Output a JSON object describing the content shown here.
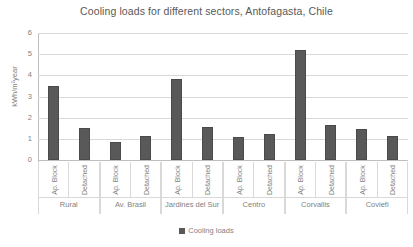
{
  "chart_data": {
    "type": "bar",
    "title": "Cooling loads for different sectors, Antofagasta, Chile",
    "xlabel": "",
    "ylabel": "kWh/m²year",
    "ylim": [
      0,
      6
    ],
    "ytick_labels": [
      "6",
      "5",
      "4",
      "3",
      "2",
      "1",
      "0"
    ],
    "ytick_values": [
      6,
      5,
      4,
      3,
      2,
      1,
      0
    ],
    "grid": true,
    "legend": {
      "position": "bottom",
      "entries": [
        "Cooling loads"
      ]
    },
    "series": [
      {
        "name": "Cooling loads",
        "color": "#595959",
        "values": [
          3.5,
          1.5,
          0.85,
          1.15,
          3.85,
          1.55,
          1.1,
          1.25,
          5.2,
          1.65,
          1.45,
          1.15
        ]
      }
    ],
    "categories": [
      "Ap. Block",
      "Detached",
      "Ap. Block",
      "Detached",
      "Ap. Block",
      "Detached",
      "Ap. Block",
      "Detached",
      "Ap. Block",
      "Detached",
      "Ap. Block",
      "Detached"
    ],
    "groups": [
      {
        "name": "Rural",
        "subcategories": [
          "Ap. Block",
          "Detached"
        ],
        "values": [
          3.5,
          1.5
        ]
      },
      {
        "name": "Av. Brasil",
        "subcategories": [
          "Ap. Block",
          "Detached"
        ],
        "values": [
          0.85,
          1.15
        ]
      },
      {
        "name": "Jardines del Sur",
        "subcategories": [
          "Ap. Block",
          "Detached"
        ],
        "values": [
          3.85,
          1.55
        ]
      },
      {
        "name": "Centro",
        "subcategories": [
          "Ap. Block",
          "Detached"
        ],
        "values": [
          1.1,
          1.25
        ]
      },
      {
        "name": "Corvallis",
        "subcategories": [
          "Ap. Block",
          "Detached"
        ],
        "values": [
          5.2,
          1.65
        ]
      },
      {
        "name": "Coviefi",
        "subcategories": [
          "Ap. Block",
          "Detached"
        ],
        "values": [
          1.45,
          1.15
        ]
      }
    ]
  },
  "colors": {
    "bar": "#595959",
    "gridline": "#d9d9d9",
    "axis": "#bfbfbf",
    "text": "#7f7f7f",
    "title": "#595959",
    "background": "#ffffff"
  },
  "legend": {
    "label": "Cooling loads"
  }
}
